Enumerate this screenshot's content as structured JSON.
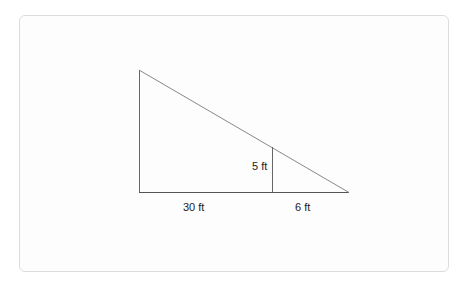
{
  "diagram": {
    "title": "",
    "shapes": {
      "large_triangle": {
        "vertices": [
          [
            139,
            70
          ],
          [
            139,
            192
          ],
          [
            349,
            192
          ]
        ]
      },
      "vertical_segment": {
        "from": [
          272,
          147
        ],
        "to": [
          272,
          192
        ]
      }
    },
    "labels": {
      "height_small": "5 ft",
      "base_left": "30 ft",
      "base_right": "6 ft"
    },
    "colors": {
      "line": "#555555",
      "hypotenuse": "#777777",
      "frame_border": "#dcdcdc"
    }
  }
}
